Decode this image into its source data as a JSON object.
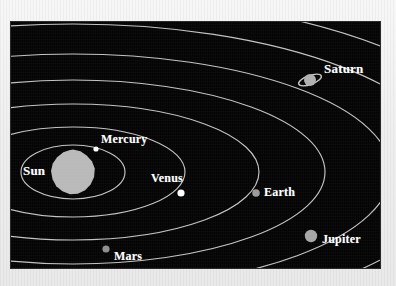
{
  "figure": {
    "kind": "solar-system-diagram",
    "plate_background": "#040404",
    "page_background": "#efefef",
    "orbit_line_color": "#d8d8d8",
    "label_color": "#ffffff"
  },
  "bodies": [
    {
      "id": "sun",
      "label": "Sun",
      "type": "star",
      "color": "#b9b9b9",
      "dot": {
        "cx": 62,
        "cy": 150,
        "r": 22
      },
      "label_pos": {
        "x": 12,
        "y": 142
      },
      "label_size": 13
    },
    {
      "id": "mercury",
      "label": "Mercury",
      "type": "planet",
      "color": "#ffffff",
      "dot": {
        "cx": 85,
        "cy": 127,
        "r": 2.6
      },
      "label_pos": {
        "x": 90,
        "y": 111
      },
      "label_size": 12
    },
    {
      "id": "venus",
      "label": "Venus",
      "type": "planet",
      "color": "#ffffff",
      "dot": {
        "cx": 170,
        "cy": 171,
        "r": 3.6
      },
      "label_pos": {
        "x": 140,
        "y": 150
      },
      "label_size": 12
    },
    {
      "id": "earth",
      "label": "Earth",
      "type": "planet",
      "color": "#9a9a9a",
      "dot": {
        "cx": 245,
        "cy": 171,
        "r": 3.8
      },
      "label_pos": {
        "x": 253,
        "y": 164
      },
      "label_size": 12
    },
    {
      "id": "mars",
      "label": "Mars",
      "type": "planet",
      "color": "#8e8e8e",
      "dot": {
        "cx": 95,
        "cy": 227,
        "r": 3.6
      },
      "label_pos": {
        "x": 103,
        "y": 228
      },
      "label_size": 12
    },
    {
      "id": "jupiter",
      "label": "Jupiter",
      "type": "planet",
      "color": "#a6a6a6",
      "dot": {
        "cx": 300,
        "cy": 214,
        "r": 6.2
      },
      "label_pos": {
        "x": 311,
        "y": 211
      },
      "label_size": 12
    },
    {
      "id": "saturn",
      "label": "Saturn",
      "type": "planet",
      "color": "#b0b0b0",
      "dot": {
        "cx": 299,
        "cy": 58,
        "r": 6.0
      },
      "ring": {
        "rx": 12,
        "ry": 4.5,
        "rotate": -20,
        "color": "#c8c8c8"
      },
      "label_pos": {
        "x": 313,
        "y": 40
      },
      "label_size": 13
    }
  ],
  "orbits": [
    {
      "id": "orbit-mercury",
      "cx": 62,
      "cy": 150,
      "rx": 52,
      "ry": 27
    },
    {
      "id": "orbit-venus",
      "cx": 62,
      "cy": 150,
      "rx": 112,
      "ry": 45
    },
    {
      "id": "orbit-earth",
      "cx": 62,
      "cy": 150,
      "rx": 186,
      "ry": 68
    },
    {
      "id": "orbit-mars",
      "cx": 62,
      "cy": 150,
      "rx": 252,
      "ry": 92
    },
    {
      "id": "orbit-jupiter",
      "cx": 62,
      "cy": 150,
      "rx": 318,
      "ry": 118
    },
    {
      "id": "orbit-saturn",
      "cx": 62,
      "cy": 150,
      "rx": 382,
      "ry": 148
    },
    {
      "id": "orbit-outer-1",
      "cx": 62,
      "cy": 150,
      "rx": 440,
      "ry": 176
    },
    {
      "id": "orbit-outer-2",
      "cx": 62,
      "cy": 150,
      "rx": 500,
      "ry": 205
    }
  ],
  "sun_blob_points": "0.00,-1.00 0.34,-0.93 0.62,-0.74 0.86,-0.48 0.99,-0.16 0.96,0.22 0.80,0.56 0.55,0.81 0.22,0.97 -0.14,0.99 -0.48,0.86 -0.76,0.63 -0.93,0.32 -1.00,-0.04 -0.92,-0.38 -0.72,-0.66 -0.44,-0.88 -0.17,-0.97"
}
